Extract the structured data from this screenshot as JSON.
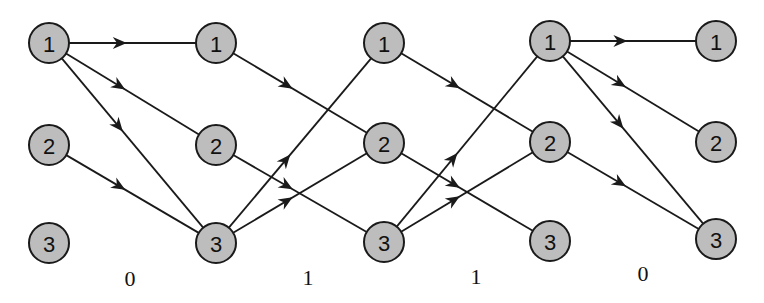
{
  "diagram": {
    "type": "trellis",
    "states": [
      "1",
      "2",
      "3"
    ],
    "columns": [
      {
        "x": 49,
        "nodes": [
          {
            "label": "1",
            "y": 43
          },
          {
            "label": "2",
            "y": 145
          },
          {
            "label": "3",
            "y": 243
          }
        ]
      },
      {
        "x": 216,
        "nodes": [
          {
            "label": "1",
            "y": 43
          },
          {
            "label": "2",
            "y": 145
          },
          {
            "label": "3",
            "y": 243
          }
        ]
      },
      {
        "x": 384,
        "nodes": [
          {
            "label": "1",
            "y": 43
          },
          {
            "label": "2",
            "y": 143
          },
          {
            "label": "3",
            "y": 242
          }
        ]
      },
      {
        "x": 550,
        "nodes": [
          {
            "label": "1",
            "y": 41
          },
          {
            "label": "2",
            "y": 142
          },
          {
            "label": "3",
            "y": 241
          }
        ]
      },
      {
        "x": 716,
        "nodes": [
          {
            "label": "1",
            "y": 41
          },
          {
            "label": "2",
            "y": 142
          },
          {
            "label": "3",
            "y": 239
          }
        ]
      }
    ],
    "stages": [
      {
        "label": "0",
        "label_x": 130,
        "label_y": 286,
        "transitions": [
          [
            "1",
            "1"
          ],
          [
            "1",
            "2"
          ],
          [
            "1",
            "3"
          ],
          [
            "2",
            "3"
          ]
        ]
      },
      {
        "label": "1",
        "label_x": 308,
        "label_y": 285,
        "transitions": [
          [
            "1",
            "2"
          ],
          [
            "2",
            "3"
          ],
          [
            "3",
            "1"
          ],
          [
            "3",
            "2"
          ]
        ]
      },
      {
        "label": "1",
        "label_x": 476,
        "label_y": 284,
        "transitions": [
          [
            "1",
            "2"
          ],
          [
            "2",
            "3"
          ],
          [
            "3",
            "1"
          ],
          [
            "3",
            "2"
          ]
        ]
      },
      {
        "label": "0",
        "label_x": 643,
        "label_y": 281,
        "transitions": [
          [
            "1",
            "1"
          ],
          [
            "1",
            "2"
          ],
          [
            "1",
            "3"
          ],
          [
            "2",
            "3"
          ]
        ]
      }
    ],
    "node_radius": 20,
    "colors": {
      "node_fill": "#bdbdbd",
      "stroke": "#1a1a1a",
      "background": "#ffffff"
    }
  }
}
